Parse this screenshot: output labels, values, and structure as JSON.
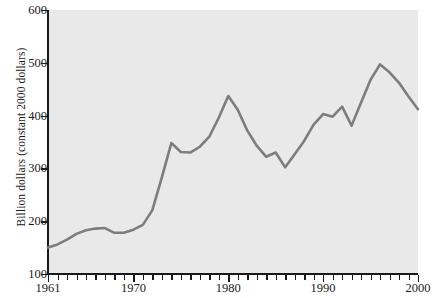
{
  "chart_data": {
    "type": "line",
    "title": "",
    "xlabel": "",
    "ylabel": "Billion dollars (constant 2000 dollars)",
    "xlim": [
      1961,
      2000
    ],
    "ylim": [
      100,
      600
    ],
    "grid": false,
    "legend": null,
    "y_ticks": [
      100,
      200,
      300,
      400,
      500,
      600
    ],
    "x_ticks": [
      1961,
      1970,
      1980,
      1990,
      2000
    ],
    "x_minor_tick_interval": 1,
    "line_color": "#7d7d7d",
    "plot_background": "#e9e9e9",
    "series": [
      {
        "name": "Billion dollars (constant 2000 dollars)",
        "x": [
          1961,
          1962,
          1963,
          1964,
          1965,
          1966,
          1967,
          1968,
          1969,
          1970,
          1971,
          1972,
          1973,
          1974,
          1975,
          1976,
          1977,
          1978,
          1979,
          1980,
          1981,
          1982,
          1983,
          1984,
          1985,
          1986,
          1987,
          1988,
          1989,
          1990,
          1991,
          1992,
          1993,
          1994,
          1995,
          1996,
          1997,
          1998,
          1999,
          2000
        ],
        "values": [
          150,
          156,
          165,
          176,
          183,
          186,
          187,
          178,
          178,
          184,
          193,
          221,
          283,
          348,
          331,
          330,
          341,
          360,
          396,
          437,
          411,
          372,
          343,
          322,
          330,
          302,
          327,
          352,
          383,
          403,
          398,
          417,
          381,
          425,
          468,
          497,
          482,
          462,
          436,
          412
        ]
      }
    ]
  }
}
